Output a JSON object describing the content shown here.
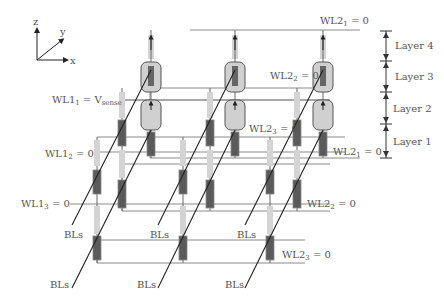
{
  "axes": {
    "z": "z",
    "y": "y",
    "x": "x"
  },
  "wordlines_left": [
    {
      "name": "WL1",
      "sub": "1",
      "value": "= V",
      "value_sub": "sense"
    },
    {
      "name": "WL1",
      "sub": "2",
      "value": "= 0"
    },
    {
      "name": "WL1",
      "sub": "3",
      "value": "= 0"
    }
  ],
  "wordlines_right": [
    {
      "name": "WL2",
      "sub": "1",
      "value": "= 0",
      "position": "top"
    },
    {
      "name": "WL2",
      "sub": "2",
      "value": "= 0",
      "position": "upper-middle"
    },
    {
      "name": "WL2",
      "sub": "3",
      "value": "= 0",
      "position": "middle"
    },
    {
      "name": "WL2",
      "sub": "1",
      "value": "= 0",
      "position": "right-layer1"
    },
    {
      "name": "WL2",
      "sub": "2",
      "value": "= 0",
      "position": "lower-right"
    },
    {
      "name": "WL2",
      "sub": "3",
      "value": "= 0",
      "position": "bottom"
    }
  ],
  "layers": [
    "Layer 4",
    "Layer 3",
    "Layer 2",
    "Layer 1"
  ],
  "bitline_label": "BLs"
}
